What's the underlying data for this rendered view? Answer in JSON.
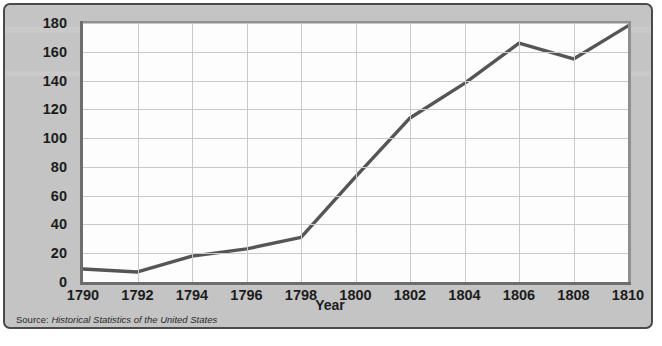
{
  "figure": {
    "source_prefix": "Source:",
    "source_title": "Historical Statistics of the United States",
    "panel_color": "#c4c4c4",
    "plot_bg_color": "#fdfdfd",
    "line_color": "#555555",
    "grid_color": "#c9c9c9",
    "axis_color": "#6d6d6d"
  },
  "chart_data": {
    "type": "line",
    "title": "",
    "subtitle": "",
    "xlabel": "Year",
    "ylabel": "Bales (in thousands)",
    "x": [
      1790,
      1792,
      1794,
      1796,
      1798,
      1800,
      1802,
      1804,
      1806,
      1808,
      1810
    ],
    "values": [
      9,
      7,
      18,
      23,
      31,
      73,
      114,
      138,
      166,
      155,
      178
    ],
    "series": [
      {
        "name": "Cotton production",
        "values": [
          9,
          7,
          18,
          23,
          31,
          73,
          114,
          138,
          166,
          155,
          178
        ]
      }
    ],
    "xlim": [
      1790,
      1810
    ],
    "ylim": [
      0,
      180
    ],
    "xticks": [
      1790,
      1792,
      1794,
      1796,
      1798,
      1800,
      1802,
      1804,
      1806,
      1808,
      1810
    ],
    "xtick_labels": [
      "1790",
      "1792",
      "1794",
      "1796",
      "1798",
      "1800",
      "1802",
      "1804",
      "1806",
      "1808",
      "1810"
    ],
    "yticks": [
      0,
      20,
      40,
      60,
      80,
      100,
      120,
      140,
      160,
      180
    ],
    "ytick_labels": [
      "0",
      "20",
      "40",
      "60",
      "80",
      "100",
      "120",
      "140",
      "160",
      "180"
    ],
    "grid": true,
    "legend": false,
    "legend_position": "none",
    "annotations": []
  }
}
